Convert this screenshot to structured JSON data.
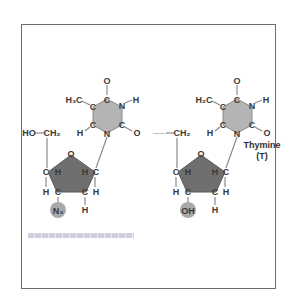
{
  "diagram": {
    "type": "chemical-structure-comparison",
    "colors": {
      "frame": "#6e6e6e",
      "base_ring_fill": "#b4b4b4",
      "sugar_ring_fill": "#6f6f6f",
      "highlight_circle": "#a9a9a9",
      "atom_text": "#3a3a3a",
      "bond": "#8a8a8a"
    },
    "left_molecule": {
      "name": "AZT",
      "atoms": {
        "carbonyl_top_o": "O",
        "ring_c_top": "C",
        "ring_n_right": "N",
        "n_h": "H",
        "methyl": "H₃C",
        "ring_c_left_upper": "C",
        "ring_c_left_lower": "C",
        "c_h": "H",
        "ring_n_bottom": "N",
        "ring_c_right_lower": "C",
        "carbonyl_right_o": "O",
        "hydroxyl": "HO",
        "ch2": "CH₂",
        "sugar_o": "O",
        "sugar_c4": "C",
        "sugar_h4": "H",
        "sugar_h1": "H",
        "sugar_c1": "C",
        "sugar_c4_h": "H",
        "sugar_c3": "C",
        "sugar_c2": "C",
        "sugar_c1_h": "H",
        "substituent": "N₃",
        "c2_h": "H"
      }
    },
    "right_molecule": {
      "name": "Thymidine",
      "atoms": {
        "carbonyl_top_o": "O",
        "ring_c_top": "C",
        "ring_n_right": "N",
        "n_h": "H",
        "methyl": "H₂C",
        "ring_c_left_upper": "C",
        "ring_c_left_lower": "C",
        "c_h": "H",
        "ring_n_bottom": "N",
        "ring_c_right_lower": "C",
        "carbonyl_right_o": "O",
        "link": "——",
        "ch2": "CH₂",
        "sugar_o": "O",
        "sugar_c4": "C",
        "sugar_h4": "H",
        "sugar_h1": "H",
        "sugar_c1": "C",
        "sugar_c4_h": "H",
        "sugar_c3": "C",
        "sugar_c2": "C",
        "sugar_c1_h": "H",
        "substituent": "OH",
        "c2_h": "H"
      },
      "base_label": "Thymine",
      "base_label_abbr": "(T)"
    },
    "caption": "caption text (illegible)"
  }
}
